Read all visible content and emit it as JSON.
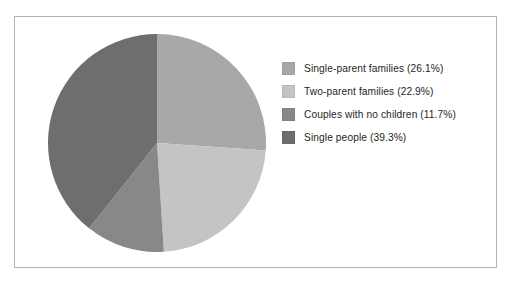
{
  "chart_data": {
    "type": "pie",
    "title": "",
    "categories": [
      "Single-parent families",
      "Two-parent families",
      "Couples with no children",
      "Single people"
    ],
    "values": [
      26.1,
      22.9,
      11.7,
      39.3
    ],
    "value_unit": "%",
    "start_angle_deg": 0,
    "direction": "clockwise",
    "legend_position": "right",
    "grid": false,
    "slice_colors": [
      "#a8a8a8",
      "#c4c4c4",
      "#888888",
      "#6e6e6e"
    ],
    "slices": [
      {
        "label": "Single-parent families",
        "value": 26.1,
        "color": "#a8a8a8"
      },
      {
        "label": "Two-parent families",
        "value": 22.9,
        "color": "#c4c4c4"
      },
      {
        "label": "Couples with no children",
        "value": 11.7,
        "color": "#888888"
      },
      {
        "label": "Single people",
        "value": 39.3,
        "color": "#6e6e6e"
      }
    ]
  },
  "legend": {
    "items": [
      {
        "label": "Single-parent families (26.1%)",
        "color": "#a8a8a8"
      },
      {
        "label": "Two-parent families (22.9%)",
        "color": "#c4c4c4"
      },
      {
        "label": "Couples with no children (11.7%)",
        "color": "#888888"
      },
      {
        "label": "Single people (39.3%)",
        "color": "#6e6e6e"
      }
    ]
  },
  "frame": {
    "border_color": "#b4b4b4",
    "background": "#ffffff"
  }
}
